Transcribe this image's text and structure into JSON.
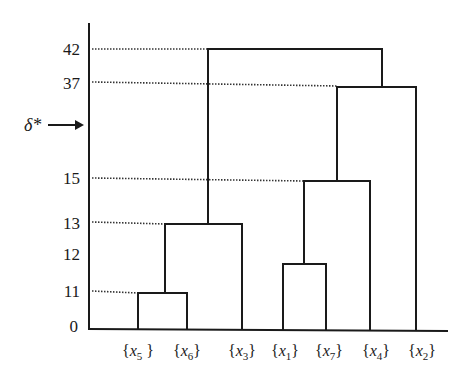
{
  "diagram": {
    "type": "dendrogram",
    "threshold_label": "δ*",
    "y_ticks": [
      {
        "label": "42",
        "y": 49
      },
      {
        "label": "37",
        "y": 83
      },
      {
        "label": "15",
        "y": 178
      },
      {
        "label": "13",
        "y": 223
      },
      {
        "label": "12",
        "y": 254
      },
      {
        "label": "11",
        "y": 291
      },
      {
        "label": "0",
        "y": 326
      }
    ],
    "leaves": [
      {
        "label": "{x5 }",
        "var": "x",
        "sub": "5",
        "x": 138
      },
      {
        "label": "{x6}",
        "var": "x",
        "sub": "6",
        "x": 187
      },
      {
        "label": "{x3}",
        "var": "x",
        "sub": "3",
        "x": 242
      },
      {
        "label": "{x1}",
        "var": "x",
        "sub": "1",
        "x": 283
      },
      {
        "label": "{x7}",
        "var": "x",
        "sub": "7",
        "x": 326
      },
      {
        "label": "{x4}",
        "var": "x",
        "sub": "4",
        "x": 370
      },
      {
        "label": "{x2}",
        "var": "x",
        "sub": "2",
        "x": 416
      }
    ],
    "merges": [
      {
        "items": [
          "x5",
          "x6"
        ],
        "height": 11
      },
      {
        "items": [
          "x5,x6",
          "x3"
        ],
        "height": 13
      },
      {
        "items": [
          "x1",
          "x7"
        ],
        "height": 12
      },
      {
        "items": [
          "x1,x7",
          "x4"
        ],
        "height": 15
      },
      {
        "items": [
          "x1,x7,x4",
          "x2"
        ],
        "height": 37
      },
      {
        "items": [
          "x5,x6,x3",
          "x1,x7,x4,x2"
        ],
        "height": 42
      }
    ],
    "threshold": {
      "label": "δ*",
      "position_between": [
        15,
        37
      ]
    }
  }
}
